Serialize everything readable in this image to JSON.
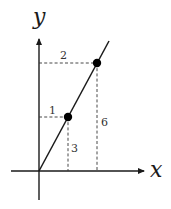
{
  "diagram": {
    "axes": {
      "x_label": "x",
      "y_label": "y"
    },
    "points": [
      {
        "name": "point-1",
        "x": 1,
        "y": 3
      },
      {
        "name": "point-2",
        "x": 2,
        "y": 6
      }
    ],
    "labels": {
      "x1": "1",
      "y1": "3",
      "x2": "2",
      "y2": "6"
    },
    "colors": {
      "ink": "#1a1a1a",
      "background": "#ffffff"
    }
  }
}
